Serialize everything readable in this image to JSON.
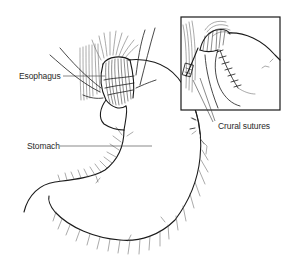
{
  "figure": {
    "type": "anatomical-illustration",
    "labels": {
      "esophagus": "Esophagus",
      "stomach": "Stomach",
      "crural_sutures": "Crural sutures"
    },
    "inset": {
      "shows": "Close-up of crural sutures at esophageal hiatus"
    },
    "colors": {
      "ink": "#1a1a1a",
      "background": "#ffffff",
      "label_text": "#2a2a2a"
    }
  }
}
